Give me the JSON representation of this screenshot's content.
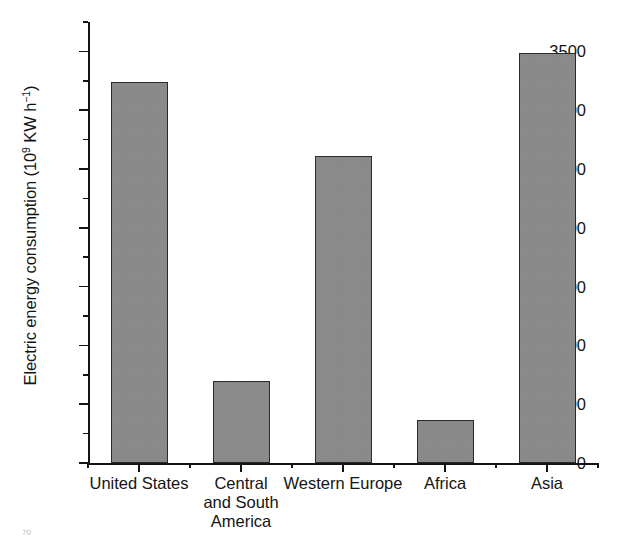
{
  "chart_data": {
    "type": "bar",
    "title": "",
    "subtitle": "",
    "xlabel": "",
    "ylabel": "Electric energy consumption (10⁹ KW h⁻¹)",
    "ylabel_parts": {
      "text_before": "Electric energy consumption (10",
      "exp1": "9",
      "text_mid": " KW h",
      "exp2": "−1",
      "text_after": ")"
    },
    "categories": [
      "United States",
      "Central and South America",
      "Western Europe",
      "Africa",
      "Asia"
    ],
    "category_lines": [
      [
        "United States"
      ],
      [
        "Central",
        "and South",
        "America"
      ],
      [
        "Western Europe"
      ],
      [
        "Africa"
      ],
      [
        "Asia"
      ]
    ],
    "values": [
      3240,
      700,
      2610,
      370,
      3490
    ],
    "ylim": [
      0,
      3750
    ],
    "ytick_values": [
      0,
      500,
      1000,
      1500,
      2000,
      2500,
      3000,
      3500
    ],
    "ytick_labels": [
      "0",
      "500",
      "1000",
      "1500",
      "2000",
      "2500",
      "3000",
      "3500"
    ],
    "yminor_values": [
      250,
      750,
      1250,
      1750,
      2250,
      2750,
      3250,
      3750
    ],
    "grid": false,
    "legend": false,
    "legend_position": "none",
    "bar_color": "#8b8b8b",
    "bar_edge_color": "#2b2b2b",
    "axis_color": "#141414",
    "background_color": "#ffffff"
  },
  "artifact": {
    "text": "70",
    "exp": "70"
  }
}
